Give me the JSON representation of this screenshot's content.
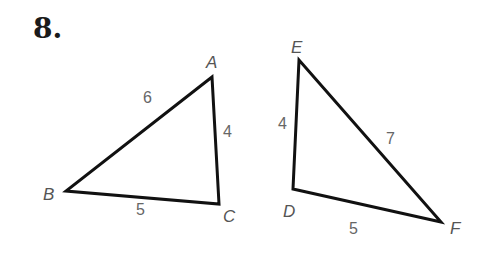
{
  "problem_number": "8.",
  "triangles": [
    {
      "name": "ABC",
      "vertices": {
        "A": "A",
        "B": "B",
        "C": "C"
      },
      "sides": {
        "AB": "6",
        "AC": "4",
        "BC": "5"
      }
    },
    {
      "name": "DEF",
      "vertices": {
        "D": "D",
        "E": "E",
        "F": "F"
      },
      "sides": {
        "DE": "4",
        "EF": "7",
        "DF": "5"
      }
    }
  ],
  "colors": {
    "stroke": "#111111",
    "label": "#555555"
  }
}
